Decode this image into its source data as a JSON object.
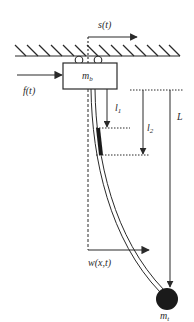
{
  "diagram": {
    "type": "mechanical-schematic",
    "labels": {
      "displacement": "s(t)",
      "force": "f(t)",
      "base_mass": "m",
      "base_mass_sub": "b",
      "length_1": "l",
      "length_1_sub": "1",
      "length_2": "l",
      "length_2_sub": "2",
      "total_length": "L",
      "deflection": "w(x,t)",
      "tip_mass": "m",
      "tip_mass_sub": "t"
    },
    "colors": {
      "stroke": "#2a2a2a",
      "fill_mass": "#1a1a1a",
      "background": "#ffffff"
    }
  }
}
